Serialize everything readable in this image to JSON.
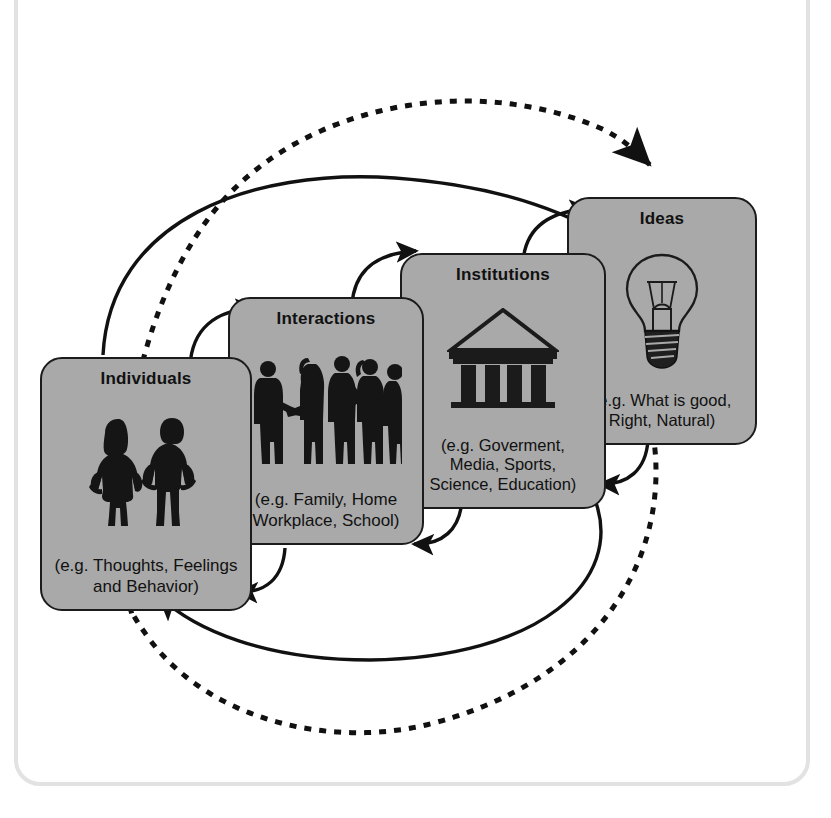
{
  "diagram": {
    "type": "cycle-diagram",
    "background_color": "#ffffff",
    "box_fill_color": "#a9a9a9",
    "box_border_color": "#1b1b1b",
    "frame_color": "#e2e2e2",
    "arrow_color": "#111111",
    "boxes": [
      {
        "id": "individuals",
        "title": "Individuals",
        "caption": "(e.g. Thoughts, Feelings\nand Behavior)",
        "icon": "two-people-silhouette-icon"
      },
      {
        "id": "interactions",
        "title": "Interactions",
        "caption": "(e.g. Family, Home\nWorkplace, School)",
        "icon": "group-conversation-silhouette-icon"
      },
      {
        "id": "institutions",
        "title": "Institutions",
        "caption": "(e.g. Goverment,\nMedia, Sports,\nScience, Education)",
        "icon": "classical-temple-icon"
      },
      {
        "id": "ideas",
        "title": "Ideas",
        "caption": "(e.g. What is good,\nRight, Natural)",
        "icon": "lightbulb-icon"
      }
    ],
    "arrows": [
      {
        "id": "individuals-to-interactions",
        "style": "solid",
        "direction": "up-right",
        "from": "individuals",
        "to": "interactions"
      },
      {
        "id": "interactions-to-institutions",
        "style": "solid",
        "direction": "up-right",
        "from": "interactions",
        "to": "institutions"
      },
      {
        "id": "institutions-to-ideas",
        "style": "solid",
        "direction": "up-right",
        "from": "institutions",
        "to": "ideas"
      },
      {
        "id": "individuals-to-institutions-arc",
        "style": "solid",
        "direction": "long-arc-right",
        "from": "individuals",
        "to": "institutions"
      },
      {
        "id": "interactions-to-individuals",
        "style": "solid",
        "direction": "down-left",
        "from": "interactions",
        "to": "individuals"
      },
      {
        "id": "institutions-to-interactions",
        "style": "solid",
        "direction": "down-left",
        "from": "institutions",
        "to": "interactions"
      },
      {
        "id": "ideas-to-institutions",
        "style": "solid",
        "direction": "down-left",
        "from": "ideas",
        "to": "institutions"
      },
      {
        "id": "institutions-to-individuals-arc",
        "style": "solid",
        "direction": "long-arc-left",
        "from": "institutions",
        "to": "individuals"
      },
      {
        "id": "ideas-feedback-dashed-arc",
        "style": "dashed",
        "direction": "long-loop",
        "from": "ideas",
        "to": "individuals"
      },
      {
        "id": "individuals-feedback-dashed-arc",
        "style": "dashed",
        "direction": "long-loop",
        "from": "individuals",
        "to": "ideas"
      }
    ]
  }
}
